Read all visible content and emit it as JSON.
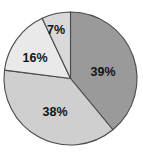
{
  "chart_data": {
    "type": "pie",
    "title": "",
    "subtitle": "",
    "xlabel": "",
    "ylabel": "",
    "legend": null,
    "legend_position": "none",
    "grid": false,
    "labels_shown_as": "percent",
    "start_angle_deg": 0,
    "direction": "clockwise",
    "categories": [
      "Segment 1",
      "Segment 2",
      "Segment 3",
      "Segment 4"
    ],
    "values": [
      39,
      38,
      16,
      7
    ],
    "total": 100,
    "slices": [
      {
        "name": "slice-39",
        "label": "39%",
        "value": 39,
        "color": "#9a9a9a",
        "start_deg": 0,
        "end_deg": 140.4,
        "label_x": 103,
        "label_y": 73
      },
      {
        "name": "slice-38",
        "label": "38%",
        "value": 38,
        "color": "#cfcfcf",
        "start_deg": 140.4,
        "end_deg": 277.2,
        "label_x": 55,
        "label_y": 113
      },
      {
        "name": "slice-16",
        "label": "16%",
        "value": 16,
        "color": "#e9e9e9",
        "start_deg": 277.2,
        "end_deg": 334.8,
        "label_x": 35,
        "label_y": 59
      },
      {
        "name": "slice-7",
        "label": "7%",
        "value": 7,
        "color": "#d9d9d9",
        "start_deg": 334.8,
        "end_deg": 360,
        "label_x": 56,
        "label_y": 31
      }
    ],
    "geometry": {
      "center_x": 70.5,
      "center_y": 78.5,
      "radius": 66.5
    },
    "colors": {
      "background": "#ffffff",
      "outline": "#4a4a4a",
      "label_text": "#141414"
    }
  }
}
